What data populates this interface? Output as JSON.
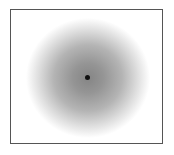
{
  "figure": {
    "type": "radial-gradient-field",
    "border_color": "#555555",
    "center_color": "#858585",
    "edge_color": "#ffffff",
    "center_marker": {
      "shape": "dot",
      "color": "#111111"
    }
  }
}
